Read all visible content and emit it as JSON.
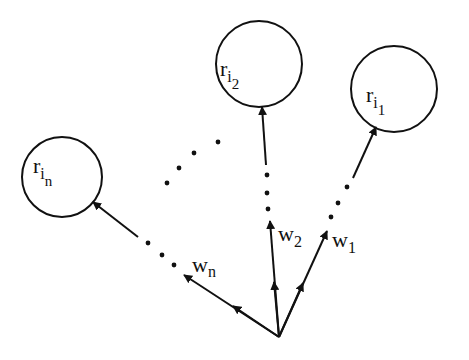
{
  "diagram": {
    "stroke_color": "#111111",
    "background": "#ffffff",
    "nodes": [
      {
        "id": "r_i2",
        "base": "r",
        "sub": "i",
        "subsub": "2",
        "cx": 259,
        "cy": 64,
        "r": 43
      },
      {
        "id": "r_i1",
        "base": "r",
        "sub": "i",
        "subsub": "1",
        "cx": 394,
        "cy": 89,
        "r": 43
      },
      {
        "id": "r_in",
        "base": "r",
        "sub": "i",
        "subsub": "n",
        "cx": 62,
        "cy": 177,
        "r": 40
      }
    ],
    "edges": [
      {
        "id": "w2",
        "label": "w",
        "label_sub": "2",
        "target": "r_i2"
      },
      {
        "id": "w1",
        "label": "w",
        "label_sub": "1",
        "target": "r_i1"
      },
      {
        "id": "wn",
        "label": "w",
        "label_sub": "n",
        "target": "r_in"
      }
    ],
    "origin": {
      "x": 279,
      "y": 337
    },
    "ellipsis": "…"
  }
}
